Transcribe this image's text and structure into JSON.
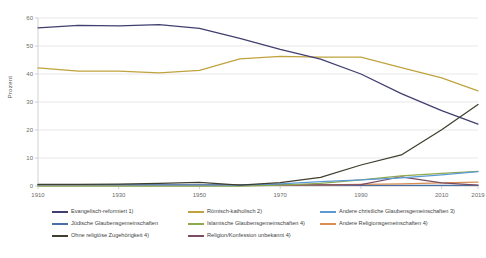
{
  "chart_data": {
    "type": "line",
    "title": "",
    "xlabel": "",
    "ylabel": "Prozent",
    "ylim": [
      0,
      60
    ],
    "yticks": [
      0,
      10,
      20,
      30,
      40,
      50,
      60
    ],
    "xticks": [
      "1910",
      "1930",
      "1950",
      "1970",
      "1990",
      "2010",
      "2019"
    ],
    "x": [
      1910,
      1920,
      1930,
      1940,
      1950,
      1960,
      1970,
      1980,
      1990,
      2000,
      2010,
      2019
    ],
    "xlim": [
      1910,
      2019
    ],
    "grid": true,
    "legend_position": "bottom",
    "series": [
      {
        "name": "Evangelisch-reformiert 1)",
        "color": "#403f6f",
        "values": [
          56.5,
          57.4,
          57.2,
          57.6,
          56.3,
          52.7,
          48.8,
          45.3,
          40.0,
          33.0,
          26.9,
          22.1
        ]
      },
      {
        "name": "Römisch-katholisch 2)",
        "color": "#c0a33e",
        "values": [
          42.2,
          41.0,
          41.0,
          40.4,
          41.3,
          45.4,
          46.3,
          46.0,
          46.0,
          42.3,
          38.6,
          34.0
        ]
      },
      {
        "name": "Andere christliche Glaubensgemeinschaften 3)",
        "color": "#5b9bd5",
        "values": [
          0.4,
          0.4,
          0.4,
          0.4,
          0.4,
          0.3,
          0.8,
          1.6,
          2.2,
          2.9,
          4.0,
          5.1
        ]
      },
      {
        "name": "Jüdische Glaubensgemeinschaften",
        "color": "#4a6fa5",
        "values": [
          0.5,
          0.5,
          0.5,
          0.5,
          0.4,
          0.3,
          0.3,
          0.3,
          0.2,
          0.2,
          0.2,
          0.2
        ]
      },
      {
        "name": "Islamische Glaubensgemeinschaften 4)",
        "color": "#8ea84c",
        "values": [
          0.0,
          0.0,
          0.0,
          0.0,
          0.0,
          0.0,
          0.3,
          0.9,
          2.2,
          3.6,
          4.5,
          5.2
        ]
      },
      {
        "name": "Andere Religionsgemeinschaften 4)",
        "color": "#d98e52",
        "values": [
          0.2,
          0.2,
          0.2,
          0.2,
          0.2,
          0.2,
          0.3,
          0.4,
          0.6,
          0.8,
          1.1,
          1.4
        ]
      },
      {
        "name": "Ohne religiöse Zugehörigkeit 4)",
        "color": "#3f3f2e",
        "values": [
          0.6,
          0.6,
          0.7,
          0.9,
          1.3,
          0.3,
          1.2,
          3.1,
          7.5,
          11.1,
          20.1,
          29.1
        ]
      },
      {
        "name": "Religion/Konfession unbekannt 4)",
        "color": "#7b4a63",
        "values": [
          0.5,
          0.5,
          0.5,
          0.5,
          0.5,
          0.4,
          0.4,
          0.4,
          0.5,
          3.3,
          1.1,
          0.3
        ]
      }
    ],
    "legend_order": [
      "Evangelisch-reformiert 1)",
      "Römisch-katholisch 2)",
      "Andere christliche Glaubensgemeinschaften 3)",
      "Jüdische Glaubensgemeinschaften",
      "Islamische Glaubensgemeinschaften 4)",
      "Andere Religionsgemeinschaften 4)",
      "Ohne religiöse Zugehörigkeit 4)",
      "Religion/Konfession unbekannt 4)"
    ]
  }
}
